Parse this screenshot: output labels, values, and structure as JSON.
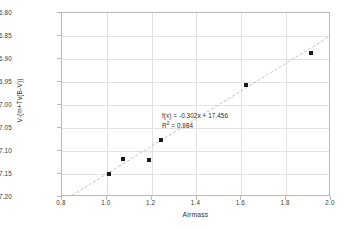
{
  "chart_data": {
    "type": "scatter",
    "title": "",
    "xlabel": "Airmass",
    "ylabel": "V-(m+Tv(B-V))",
    "xlim": [
      0.8,
      2.0
    ],
    "ylim": [
      17.2,
      16.8
    ],
    "y_inverted": true,
    "grid": true,
    "legend": "none",
    "xticks": [
      "0.8",
      "1.0",
      "1.2",
      "1.4",
      "1.6",
      "1.8",
      "2.0"
    ],
    "xtick_values": [
      0.8,
      1.0,
      1.2,
      1.4,
      1.6,
      1.8,
      2.0
    ],
    "yticks": [
      "16.80",
      "16.85",
      "16.90",
      "16.95",
      "17.00",
      "17.05",
      "17.10",
      "17.15",
      "17.20"
    ],
    "ytick_values": [
      16.8,
      16.85,
      16.9,
      16.95,
      17.0,
      17.05,
      17.1,
      17.15,
      17.2
    ],
    "series": [
      {
        "name": "observations",
        "marker": "square",
        "color": "#1a1a1a",
        "x": [
          1.01,
          1.07,
          1.19,
          1.24,
          1.62,
          1.91
        ],
        "y": [
          17.149,
          17.117,
          17.12,
          17.077,
          16.957,
          16.888
        ]
      }
    ],
    "trendline": {
      "type": "linear",
      "style": "dashed",
      "color": "#c0c0c0",
      "slope": -0.302,
      "intercept": 17.456,
      "x_start": 0.845,
      "x_end": 2.0,
      "equation_label": "f(x) = -0.302x + 17.456",
      "r_squared_label": "R",
      "r_squared_sup": "2",
      "r_squared_value": " = 0.984"
    }
  },
  "annotations": {
    "equation": "f(x) = -0.302x + 17.456",
    "r2_prefix": "R",
    "r2_sup": "2",
    "r2_value": " = 0.984"
  },
  "axes": {
    "x_title": "Airmass",
    "y_title": "V-(m+Tv(B-V))"
  },
  "colors": {
    "marker": "#1a1a1a",
    "trendline": "#c0c0c0",
    "grid": "#e2e2e2",
    "frame": "#b9b9b9",
    "text": "#3a3a3a",
    "background": "#ffffff"
  }
}
